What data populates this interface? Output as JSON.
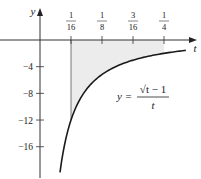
{
  "chart_data": {
    "type": "area",
    "title": "",
    "xlabel": "t",
    "ylabel": "y",
    "function": "y = (sqrt(t) - 1) / t",
    "equation_label": {
      "lhs": "y =",
      "numerator": "√t − 1",
      "denominator": "t"
    },
    "x_ticks": [
      {
        "value": 0.0625,
        "num": "1",
        "den": "16"
      },
      {
        "value": 0.125,
        "num": "1",
        "den": "8"
      },
      {
        "value": 0.1875,
        "num": "3",
        "den": "16"
      },
      {
        "value": 0.25,
        "num": "1",
        "den": "4"
      }
    ],
    "y_ticks": [
      {
        "value": -4,
        "label": "−4"
      },
      {
        "value": -8,
        "label": "−8"
      },
      {
        "value": -12,
        "label": "−12"
      },
      {
        "value": -16,
        "label": "−16"
      }
    ],
    "shaded_region": {
      "from": 0.0625,
      "to": 0.25,
      "between": "curve and t-axis"
    },
    "xlim": [
      -0.08,
      0.32
    ],
    "ylim": [
      -20,
      5
    ],
    "sample_points": [
      {
        "t": 0.0403,
        "y": -19.8
      },
      {
        "t": 0.0625,
        "y": -12
      },
      {
        "t": 0.125,
        "y": -5.17
      },
      {
        "t": 0.1875,
        "y": -3.02
      },
      {
        "t": 0.25,
        "y": -2
      },
      {
        "t": 0.294,
        "y": -1.55
      }
    ],
    "grid": false,
    "colors": {
      "curve": "#1a1a1a",
      "shade": "#ececec",
      "axis": "#333333"
    }
  }
}
